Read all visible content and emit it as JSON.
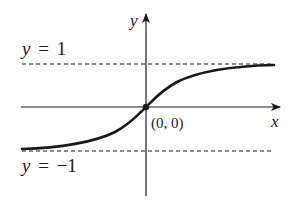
{
  "diagram": {
    "type": "function-graph",
    "axes": {
      "x_label": "x",
      "y_label": "y",
      "origin_label": "(0, 0)"
    },
    "asymptotes": [
      {
        "name": "upper",
        "var": "y",
        "eq": "=",
        "value": "1"
      },
      {
        "name": "lower",
        "var": "y",
        "eq": "=",
        "value": "−1"
      }
    ],
    "curve": {
      "description": "increasing S-shaped curve through origin approaching y=1 and y=-1",
      "passes_through": [
        0,
        0
      ]
    },
    "colors": {
      "ink": "#1a1a1a",
      "background": "#ffffff"
    }
  }
}
